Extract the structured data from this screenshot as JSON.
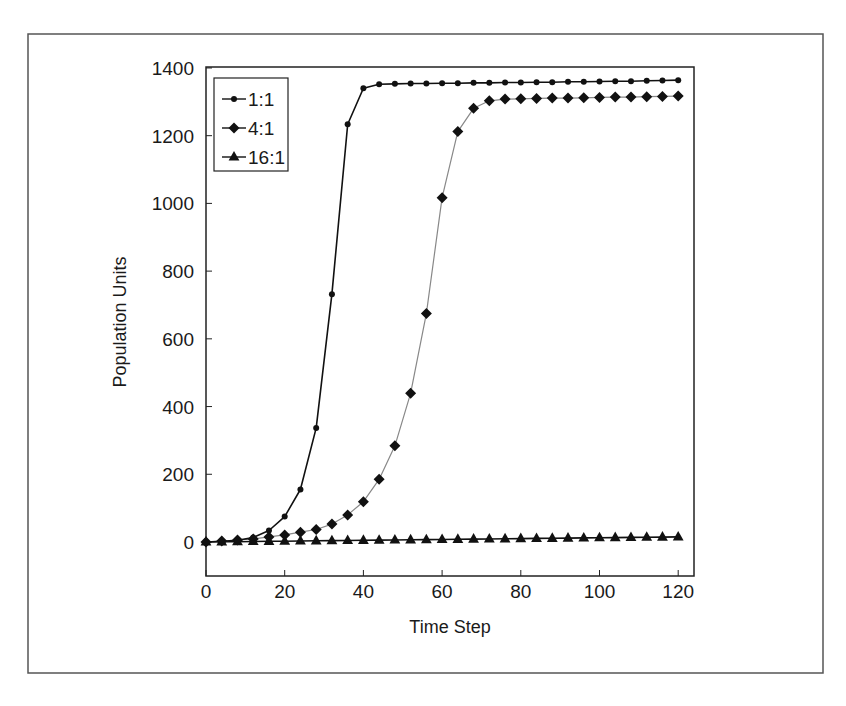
{
  "chart_data": {
    "type": "line",
    "title": "",
    "xlabel": "Time Step",
    "ylabel": "Population Units",
    "xlim": [
      0,
      124
    ],
    "ylim": [
      -100,
      1400
    ],
    "xticks": [
      0,
      20,
      40,
      60,
      80,
      100,
      120
    ],
    "yticks": [
      0,
      200,
      400,
      600,
      800,
      1000,
      1200,
      1400
    ],
    "grid": false,
    "legend_position": "upper-left-inside",
    "x": [
      0,
      4,
      8,
      12,
      16,
      20,
      24,
      28,
      32,
      36,
      40,
      44,
      48,
      52,
      56,
      60,
      64,
      68,
      72,
      76,
      80,
      84,
      88,
      92,
      96,
      100,
      104,
      108,
      112,
      116,
      120
    ],
    "series": [
      {
        "name": "1:1",
        "marker": "circle",
        "values": [
          0,
          2,
          5,
          13,
          34,
          75,
          155,
          337,
          732,
          1234,
          1340,
          1352,
          1353,
          1354,
          1354,
          1355,
          1355,
          1356,
          1356,
          1357,
          1357,
          1358,
          1358,
          1359,
          1359,
          1360,
          1361,
          1361,
          1362,
          1363,
          1364
        ]
      },
      {
        "name": "4:1",
        "marker": "diamond",
        "values": [
          0,
          3,
          6,
          9,
          15,
          21,
          29,
          37,
          53,
          80,
          119,
          185,
          284,
          439,
          675,
          1017,
          1212,
          1281,
          1303,
          1308,
          1309,
          1310,
          1311,
          1311,
          1312,
          1313,
          1314,
          1314,
          1315,
          1316,
          1317
        ]
      },
      {
        "name": "16:1",
        "marker": "triangle",
        "values": [
          0,
          0.5,
          1,
          1.5,
          2,
          2.5,
          3,
          3.5,
          4,
          4.5,
          5,
          5.5,
          6,
          6.5,
          7,
          7.5,
          8,
          8.5,
          9,
          9.5,
          10,
          10.5,
          11,
          11.5,
          12,
          12.5,
          13,
          13.5,
          14,
          14.5,
          15
        ]
      }
    ]
  },
  "axes": {
    "x_title": "Time Step",
    "y_title": "Population Units",
    "x_tick_labels": [
      "0",
      "20",
      "40",
      "60",
      "80",
      "100",
      "120"
    ],
    "y_tick_labels": [
      "0",
      "200",
      "400",
      "600",
      "800",
      "1000",
      "1200",
      "1400"
    ]
  },
  "legend": {
    "items": [
      {
        "label": "1:1",
        "marker": "circle"
      },
      {
        "label": "4:1",
        "marker": "diamond"
      },
      {
        "label": "16:1",
        "marker": "triangle"
      }
    ]
  },
  "colors": {
    "frame": "#555555",
    "axis": "#222222",
    "series_1_1": "#111111",
    "series_4_1_line": "#888888",
    "series_4_1_marker": "#111111",
    "series_16_1": "#111111"
  }
}
